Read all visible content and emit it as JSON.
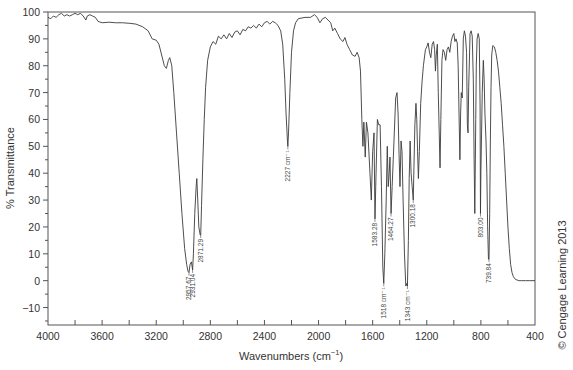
{
  "chart_data": {
    "type": "line",
    "title": "",
    "xlabel": "Wavenumbers (cm⁻¹)",
    "xlabel_base": "Wavenumbers (cm",
    "xlabel_sup": "−1",
    "xlabel_close": ")",
    "ylabel": "% Transmittance",
    "xlim": [
      4000,
      400
    ],
    "ylim": [
      -16.5,
      100
    ],
    "x_ticks": [
      4000,
      3600,
      3200,
      2800,
      2400,
      2000,
      1600,
      1200,
      800,
      400
    ],
    "x_tick_labels": [
      "4000",
      "3600",
      "3200",
      "2800",
      "2400",
      "2000",
      "1600",
      "1200",
      "800",
      "400"
    ],
    "x_minor_ticks": [
      3800,
      3400,
      3000,
      2600,
      2200,
      1800,
      1400,
      1000,
      600
    ],
    "y_ticks": [
      100,
      90,
      80,
      70,
      60,
      50,
      40,
      30,
      20,
      10,
      0,
      -10
    ],
    "y_tick_labels": [
      "100",
      "90",
      "80",
      "70",
      "60",
      "50",
      "40",
      "30",
      "20",
      "10",
      "0",
      "−10"
    ],
    "y_minor_ticks": [
      95,
      85,
      75,
      65,
      55,
      45,
      35,
      25,
      15,
      5,
      -5,
      -15
    ],
    "grid": false,
    "legend": "none",
    "series": [
      {
        "name": "IR spectrum",
        "points": [
          [
            4000,
            98
          ],
          [
            3980,
            97.5
          ],
          [
            3960,
            98.5
          ],
          [
            3940,
            98
          ],
          [
            3920,
            99
          ],
          [
            3900,
            99.5
          ],
          [
            3880,
            98.5
          ],
          [
            3860,
            99
          ],
          [
            3840,
            98.5
          ],
          [
            3820,
            99
          ],
          [
            3800,
            99.5
          ],
          [
            3780,
            99
          ],
          [
            3760,
            99.5
          ],
          [
            3740,
            98.5
          ],
          [
            3720,
            97
          ],
          [
            3710,
            98.5
          ],
          [
            3690,
            99
          ],
          [
            3670,
            98.5
          ],
          [
            3650,
            98
          ],
          [
            3630,
            96.5
          ],
          [
            3600,
            96
          ],
          [
            3550,
            96.2
          ],
          [
            3500,
            96
          ],
          [
            3450,
            96
          ],
          [
            3400,
            95.8
          ],
          [
            3350,
            95.5
          ],
          [
            3300,
            94.5
          ],
          [
            3260,
            93
          ],
          [
            3230,
            90
          ],
          [
            3200,
            89.5
          ],
          [
            3180,
            88
          ],
          [
            3160,
            84
          ],
          [
            3140,
            80
          ],
          [
            3125,
            79
          ],
          [
            3110,
            82
          ],
          [
            3100,
            83
          ],
          [
            3085,
            80
          ],
          [
            3070,
            70
          ],
          [
            3050,
            55
          ],
          [
            3030,
            40
          ],
          [
            3010,
            25
          ],
          [
            2990,
            12
          ],
          [
            2975,
            6
          ],
          [
            2965,
            3.5
          ],
          [
            2958,
            3
          ],
          [
            2950,
            6
          ],
          [
            2940,
            7
          ],
          [
            2931,
            4
          ],
          [
            2925,
            10
          ],
          [
            2915,
            25
          ],
          [
            2905,
            35
          ],
          [
            2900,
            38
          ],
          [
            2893,
            30
          ],
          [
            2885,
            20
          ],
          [
            2875,
            17
          ],
          [
            2871,
            17
          ],
          [
            2865,
            28
          ],
          [
            2855,
            45
          ],
          [
            2845,
            60
          ],
          [
            2835,
            72
          ],
          [
            2820,
            82
          ],
          [
            2800,
            87
          ],
          [
            2780,
            89
          ],
          [
            2760,
            88
          ],
          [
            2740,
            91
          ],
          [
            2720,
            90
          ],
          [
            2700,
            91.5
          ],
          [
            2680,
            90
          ],
          [
            2660,
            92
          ],
          [
            2640,
            90.5
          ],
          [
            2620,
            92.5
          ],
          [
            2600,
            93
          ],
          [
            2580,
            91.5
          ],
          [
            2560,
            93.5
          ],
          [
            2540,
            93
          ],
          [
            2520,
            94.5
          ],
          [
            2500,
            94
          ],
          [
            2480,
            95
          ],
          [
            2460,
            94
          ],
          [
            2440,
            95.5
          ],
          [
            2420,
            94.5
          ],
          [
            2400,
            96
          ],
          [
            2380,
            96.5
          ],
          [
            2360,
            95.5
          ],
          [
            2340,
            96.5
          ],
          [
            2320,
            96
          ],
          [
            2300,
            95
          ],
          [
            2280,
            93
          ],
          [
            2265,
            88
          ],
          [
            2250,
            75
          ],
          [
            2240,
            62
          ],
          [
            2230,
            52
          ],
          [
            2227,
            50
          ],
          [
            2222,
            55
          ],
          [
            2212,
            70
          ],
          [
            2200,
            85
          ],
          [
            2185,
            93
          ],
          [
            2170,
            96
          ],
          [
            2150,
            97.5
          ],
          [
            2100,
            98
          ],
          [
            2060,
            98
          ],
          [
            2030,
            99
          ],
          [
            2010,
            98
          ],
          [
            1990,
            96
          ],
          [
            1970,
            97.5
          ],
          [
            1950,
            98
          ],
          [
            1930,
            97
          ],
          [
            1910,
            96
          ],
          [
            1895,
            93
          ],
          [
            1880,
            94
          ],
          [
            1860,
            92
          ],
          [
            1840,
            90
          ],
          [
            1820,
            89
          ],
          [
            1805,
            90.5
          ],
          [
            1790,
            88
          ],
          [
            1770,
            86
          ],
          [
            1750,
            84
          ],
          [
            1730,
            83.5
          ],
          [
            1715,
            85
          ],
          [
            1700,
            83
          ],
          [
            1690,
            78
          ],
          [
            1680,
            60
          ],
          [
            1672,
            50
          ],
          [
            1665,
            59
          ],
          [
            1655,
            46
          ],
          [
            1646,
            59
          ],
          [
            1635,
            55
          ],
          [
            1620,
            40
          ],
          [
            1610,
            30
          ],
          [
            1600,
            48
          ],
          [
            1590,
            55
          ],
          [
            1583,
            23
          ],
          [
            1575,
            40
          ],
          [
            1565,
            60
          ],
          [
            1555,
            58
          ],
          [
            1545,
            58
          ],
          [
            1535,
            35
          ],
          [
            1525,
            5
          ],
          [
            1518,
            -1
          ],
          [
            1510,
            10
          ],
          [
            1500,
            30
          ],
          [
            1492,
            50
          ],
          [
            1485,
            35
          ],
          [
            1478,
            40
          ],
          [
            1472,
            46
          ],
          [
            1464,
            25
          ],
          [
            1456,
            35
          ],
          [
            1448,
            45
          ],
          [
            1440,
            55
          ],
          [
            1430,
            68
          ],
          [
            1420,
            70
          ],
          [
            1412,
            62
          ],
          [
            1405,
            47
          ],
          [
            1398,
            35
          ],
          [
            1390,
            52
          ],
          [
            1383,
            48
          ],
          [
            1375,
            30
          ],
          [
            1365,
            10
          ],
          [
            1355,
            -2
          ],
          [
            1347,
            -1
          ],
          [
            1343,
            -2
          ],
          [
            1336,
            15
          ],
          [
            1330,
            38
          ],
          [
            1323,
            52
          ],
          [
            1316,
            40
          ],
          [
            1308,
            35
          ],
          [
            1300,
            30
          ],
          [
            1295,
            42
          ],
          [
            1288,
            58
          ],
          [
            1280,
            66
          ],
          [
            1274,
            60
          ],
          [
            1268,
            48
          ],
          [
            1262,
            38
          ],
          [
            1255,
            48
          ],
          [
            1245,
            66
          ],
          [
            1235,
            74
          ],
          [
            1225,
            80
          ],
          [
            1210,
            86
          ],
          [
            1200,
            87
          ],
          [
            1190,
            88.5
          ],
          [
            1180,
            85
          ],
          [
            1170,
            83
          ],
          [
            1160,
            88
          ],
          [
            1150,
            89
          ],
          [
            1142,
            86
          ],
          [
            1136,
            78
          ],
          [
            1130,
            84
          ],
          [
            1122,
            88
          ],
          [
            1115,
            70
          ],
          [
            1108,
            55
          ],
          [
            1102,
            42
          ],
          [
            1096,
            60
          ],
          [
            1088,
            82
          ],
          [
            1080,
            86
          ],
          [
            1070,
            85
          ],
          [
            1060,
            82
          ],
          [
            1050,
            86
          ],
          [
            1040,
            87
          ],
          [
            1030,
            85
          ],
          [
            1020,
            89
          ],
          [
            1010,
            91
          ],
          [
            1000,
            92
          ],
          [
            992,
            89
          ],
          [
            984,
            90
          ],
          [
            975,
            88.5
          ],
          [
            968,
            80
          ],
          [
            960,
            58
          ],
          [
            955,
            45
          ],
          [
            950,
            62
          ],
          [
            945,
            70
          ],
          [
            938,
            68
          ],
          [
            930,
            90
          ],
          [
            922,
            93
          ],
          [
            914,
            91
          ],
          [
            906,
            85
          ],
          [
            900,
            58
          ],
          [
            895,
            55
          ],
          [
            890,
            72
          ],
          [
            880,
            92
          ],
          [
            872,
            93
          ],
          [
            864,
            91
          ],
          [
            856,
            75
          ],
          [
            850,
            45
          ],
          [
            845,
            25
          ],
          [
            842,
            40
          ],
          [
            838,
            60
          ],
          [
            834,
            80
          ],
          [
            828,
            90
          ],
          [
            820,
            92
          ],
          [
            812,
            90
          ],
          [
            806,
            65
          ],
          [
            803,
            25
          ],
          [
            800,
            40
          ],
          [
            795,
            55
          ],
          [
            790,
            70
          ],
          [
            782,
            82
          ],
          [
            776,
            75
          ],
          [
            770,
            62
          ],
          [
            762,
            52
          ],
          [
            756,
            40
          ],
          [
            750,
            20
          ],
          [
            744,
            8
          ],
          [
            740,
            8
          ],
          [
            735,
            25
          ],
          [
            730,
            52
          ],
          [
            725,
            72
          ],
          [
            720,
            84
          ],
          [
            712,
            87.5
          ],
          [
            700,
            87
          ],
          [
            690,
            85
          ],
          [
            680,
            82
          ],
          [
            670,
            78
          ],
          [
            660,
            72
          ],
          [
            650,
            66
          ],
          [
            640,
            58
          ],
          [
            630,
            50
          ],
          [
            620,
            40
          ],
          [
            610,
            30
          ],
          [
            600,
            20
          ],
          [
            590,
            12
          ],
          [
            580,
            6
          ],
          [
            570,
            3
          ],
          [
            560,
            1.5
          ],
          [
            545,
            0.5
          ],
          [
            520,
            0
          ],
          [
            500,
            0
          ],
          [
            470,
            0
          ],
          [
            440,
            0
          ],
          [
            400,
            0
          ]
        ]
      }
    ],
    "peak_annotations": [
      {
        "x": 2957.67,
        "y": 3,
        "label": "2957.67"
      },
      {
        "x": 2931.04,
        "y": 4,
        "label": "2931.04"
      },
      {
        "x": 2871.29,
        "y": 17,
        "label": "2871.29"
      },
      {
        "x": 2227,
        "y": 50,
        "label": "2227 cm⁻¹"
      },
      {
        "x": 1583.28,
        "y": 23,
        "label": "1583.28"
      },
      {
        "x": 1518,
        "y": -1,
        "label": "1518 cm⁻¹"
      },
      {
        "x": 1464.27,
        "y": 25,
        "label": "1464.27"
      },
      {
        "x": 1343,
        "y": -2,
        "label": "1343 cm⁻¹"
      },
      {
        "x": 1300.18,
        "y": 30,
        "label": "1300.18"
      },
      {
        "x": 803.0,
        "y": 25,
        "label": "803.00"
      },
      {
        "x": 739.84,
        "y": 8,
        "label": "739.84"
      }
    ]
  },
  "copyright": "© Cengage Learning 2013",
  "colors": {
    "line": "#3a3a3a",
    "axis": "#555555",
    "text": "#333333"
  }
}
